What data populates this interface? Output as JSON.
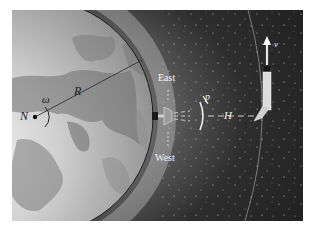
{
  "figure": {
    "labels": {
      "north_pole": "N",
      "angular_velocity": "ω",
      "radius": "R",
      "east": "East",
      "west": "West",
      "dish_parameter": "p",
      "altitude": "H",
      "velocity": "v"
    },
    "colors": {
      "space": "#2a2a2a",
      "earth_ocean": "#8c8c8c",
      "earth_land": "#bdbdbd",
      "glow": "#d9d9d9",
      "text_light": "#f2f2f2",
      "text_dark": "#1a1a1a"
    }
  }
}
